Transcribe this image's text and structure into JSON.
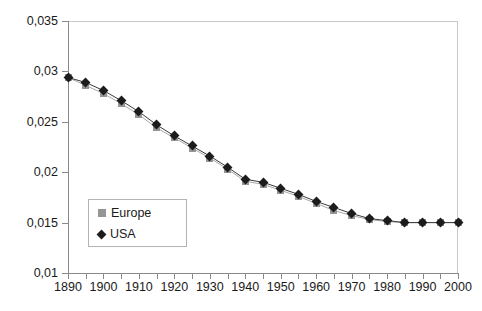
{
  "chart_data": {
    "type": "line",
    "title": "",
    "xlabel": "",
    "ylabel": "",
    "x": [
      1890,
      1895,
      1900,
      1905,
      1910,
      1915,
      1920,
      1925,
      1930,
      1935,
      1940,
      1945,
      1950,
      1955,
      1960,
      1965,
      1970,
      1975,
      1980,
      1985,
      1990,
      1995,
      2000
    ],
    "xlim": [
      1890,
      2000
    ],
    "ylim": [
      0.01,
      0.035
    ],
    "y_ticks": [
      0.01,
      0.015,
      0.02,
      0.025,
      0.03,
      0.035
    ],
    "y_tick_labels": [
      "0,01",
      "0,015",
      "0,02",
      "0,025",
      "0,03",
      "0,035"
    ],
    "x_ticks": [
      1890,
      1900,
      1910,
      1920,
      1930,
      1940,
      1950,
      1960,
      1970,
      1980,
      1990,
      2000
    ],
    "x_tick_labels": [
      "1890",
      "1900",
      "1910",
      "1920",
      "1930",
      "1940",
      "1950",
      "1960",
      "1970",
      "1980",
      "1990",
      "2000"
    ],
    "x_minor_tick_interval": 5,
    "grid": false,
    "legend_position": "inside-lower-left",
    "series": [
      {
        "name": "Europe",
        "color": "#959595",
        "marker": "square",
        "values": [
          0.0294,
          0.0286,
          0.0278,
          0.0268,
          0.0257,
          0.0244,
          0.0234,
          0.0224,
          0.0214,
          0.0203,
          0.0191,
          0.0188,
          0.0182,
          0.0176,
          0.0169,
          0.0162,
          0.0157,
          0.0153,
          0.0151,
          0.015,
          0.015,
          0.015,
          0.015
        ]
      },
      {
        "name": "USA",
        "color": "#1c1c1c",
        "marker": "diamond",
        "values": [
          0.0294,
          0.0289,
          0.0281,
          0.0271,
          0.026,
          0.0247,
          0.0236,
          0.0226,
          0.0216,
          0.0205,
          0.0193,
          0.019,
          0.0184,
          0.0178,
          0.0171,
          0.0165,
          0.0159,
          0.0154,
          0.0152,
          0.015,
          0.015,
          0.015,
          0.015
        ]
      }
    ]
  }
}
